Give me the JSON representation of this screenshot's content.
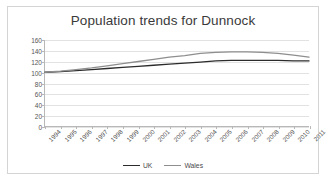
{
  "chart_data": {
    "type": "line",
    "title": "Population trends for Dunnock",
    "xlabel": "",
    "ylabel": "",
    "ylim": [
      0,
      160
    ],
    "ytick_step": 20,
    "yticks": [
      0,
      20,
      40,
      60,
      80,
      100,
      120,
      140,
      160
    ],
    "grid": true,
    "legend_position": "bottom",
    "categories": [
      "1994",
      "1995",
      "1996",
      "1997",
      "1998",
      "1999",
      "2000",
      "2001",
      "2002",
      "2003",
      "2004",
      "2005",
      "2006",
      "2007",
      "2008",
      "2009",
      "2010",
      "2011"
    ],
    "series": [
      {
        "name": "UK",
        "color": "#2b2b2b",
        "values": [
          100,
          101,
          103,
          105,
          107,
          109,
          111,
          113,
          115,
          117,
          119,
          121,
          122,
          122,
          122,
          122,
          121,
          121
        ]
      },
      {
        "name": "Wales",
        "color": "#8e8e8e",
        "values": [
          100,
          102,
          105,
          108,
          112,
          116,
          120,
          124,
          128,
          131,
          135,
          137,
          138,
          138,
          137,
          135,
          132,
          128
        ]
      }
    ]
  },
  "legend": {
    "items": [
      {
        "label": "UK",
        "color": "#2b2b2b"
      },
      {
        "label": "Wales",
        "color": "#8e8e8e"
      }
    ]
  },
  "colors": {
    "frame_border": "#d4d4d4",
    "axis": "#b8b8b8",
    "gridline": "#e2e2e2",
    "title_text": "#3a3a3a",
    "tick_text": "#555555",
    "background": "#ffffff"
  }
}
